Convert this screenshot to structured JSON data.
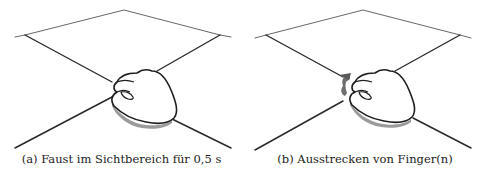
{
  "figure": {
    "panels": [
      {
        "id": "a",
        "label": "(a)",
        "caption": "Faust im Sichtbereich für 0,5 s",
        "illustration": "fist-over-view-frustum",
        "motion_indicator": false
      },
      {
        "id": "b",
        "label": "(b)",
        "caption": "Ausstrecken von Finger(n)",
        "illustration": "finger-extension-over-view-frustum",
        "motion_indicator": true
      }
    ],
    "colors": {
      "line": "#2a2a2a",
      "thin_line": "#555555",
      "shadow": "#8a8a8a",
      "motion_arrow": "#6e6e6e",
      "background": "#ffffff"
    }
  }
}
